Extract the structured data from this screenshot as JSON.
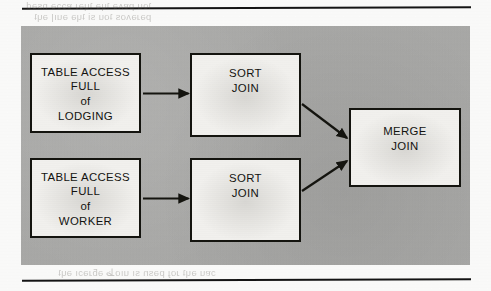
{
  "page": {
    "width": 491,
    "height": 291,
    "background_color": "#fdfdfc",
    "rule_color": "#141414",
    "panel_color": "#a9a9a7",
    "box_fill_color": "#f2f1ee",
    "ink_color": "#131310"
  },
  "bleed_through": {
    "top_line_1": "ʇou pɐʌǝ ʇɥǝ ʇɥǝɹ ɐɔɔǝ nsǝd",
    "top_line_2": "pǝɹǝʌos ʇou si ʇɥǝ ǝuıן ǝɥʇ",
    "bottom_line_1": "ɔɐu ǝɥʇ ɹoɟ pǝsn sı uıoظ ǝƃɹǝɔı ǝɥʇ"
  },
  "figure": {
    "type": "execution-plan-flow-diagram",
    "boxes": [
      {
        "id": "table-access-lodging",
        "lines": [
          "TABLE ACCESS",
          "FULL",
          "of",
          "LODGING"
        ],
        "column": "left",
        "row": "top"
      },
      {
        "id": "table-access-worker",
        "lines": [
          "TABLE ACCESS",
          "FULL",
          "of",
          "WORKER"
        ],
        "column": "left",
        "row": "bottom"
      },
      {
        "id": "sort-join-top",
        "lines": [
          "SORT",
          "JOIN"
        ],
        "column": "middle",
        "row": "top"
      },
      {
        "id": "sort-join-bottom",
        "lines": [
          "SORT",
          "JOIN"
        ],
        "column": "middle",
        "row": "bottom"
      },
      {
        "id": "merge-join",
        "lines": [
          "MERGE",
          "JOIN"
        ],
        "column": "right",
        "row": "center"
      }
    ],
    "arrows": [
      {
        "id": "lodging-to-sort-top",
        "from": "table-access-lodging",
        "to": "sort-join-top",
        "direction": "right"
      },
      {
        "id": "worker-to-sort-bottom",
        "from": "table-access-worker",
        "to": "sort-join-bottom",
        "direction": "right"
      },
      {
        "id": "sort-top-to-merge",
        "from": "sort-join-top",
        "to": "merge-join",
        "direction": "down-right"
      },
      {
        "id": "sort-bottom-to-merge",
        "from": "sort-join-bottom",
        "to": "merge-join",
        "direction": "up-right"
      }
    ]
  }
}
